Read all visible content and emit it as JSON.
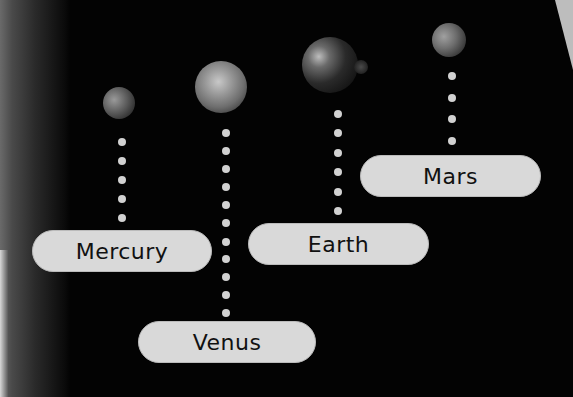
{
  "diagram": {
    "background_color": "#000000",
    "planets": [
      {
        "name": "Mercury",
        "label": "Mercury",
        "cx": 119,
        "cy": 103,
        "r": 16,
        "dot_x": 122,
        "dots_y": [
          142,
          161,
          180,
          199,
          218
        ],
        "pill": {
          "x": 32,
          "y": 230,
          "w": 180
        }
      },
      {
        "name": "Venus",
        "label": "Venus",
        "cx": 221,
        "cy": 87,
        "r": 26,
        "dot_x": 226,
        "dots_y": [
          133,
          151,
          169,
          187,
          205,
          223,
          242,
          259,
          277,
          295,
          313
        ],
        "pill": {
          "x": 138,
          "y": 321,
          "w": 178
        }
      },
      {
        "name": "Earth",
        "label": "Earth",
        "cx": 330,
        "cy": 65,
        "r": 28,
        "dot_x": 338,
        "dots_y": [
          114,
          133,
          153,
          172,
          192,
          211
        ],
        "pill": {
          "x": 248,
          "y": 223,
          "w": 181
        }
      },
      {
        "name": "Mars",
        "label": "Mars",
        "cx": 449,
        "cy": 40,
        "r": 17,
        "dot_x": 452,
        "dots_y": [
          76,
          98,
          119,
          141
        ],
        "pill": {
          "x": 360,
          "y": 155,
          "w": 181
        }
      }
    ],
    "label_color": "#d9d9d9",
    "dot_color": "#d2d2d2"
  }
}
